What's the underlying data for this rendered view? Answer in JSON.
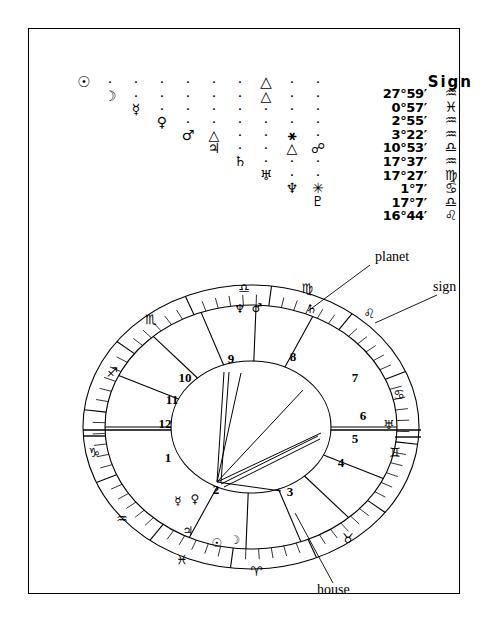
{
  "document": {
    "type": "astrological-natal-chart",
    "border_color": "#000000",
    "background": "#ffffff"
  },
  "aspect_grid": {
    "planets": [
      {
        "name": "Sun",
        "glyph": "☉"
      },
      {
        "name": "Moon",
        "glyph": "☽"
      },
      {
        "name": "Mercury",
        "glyph": "☿"
      },
      {
        "name": "Venus",
        "glyph": "♀"
      },
      {
        "name": "Mars",
        "glyph": "♂"
      },
      {
        "name": "Jupiter",
        "glyph": "♃"
      },
      {
        "name": "Saturn",
        "glyph": "♄"
      },
      {
        "name": "Uranus",
        "glyph": "♅"
      },
      {
        "name": "Neptune",
        "glyph": "♆"
      },
      {
        "name": "Pluto",
        "glyph": "♇"
      }
    ],
    "dot_glyph": "·",
    "columns": [
      {
        "planet": "Sun",
        "cells": [
          "☉"
        ]
      },
      {
        "planet": "Moon",
        "cells": [
          "·",
          "☽"
        ]
      },
      {
        "planet": "Mercury",
        "cells": [
          "·",
          "·",
          "☿"
        ]
      },
      {
        "planet": "Venus",
        "cells": [
          "·",
          "·",
          "·",
          "♀"
        ]
      },
      {
        "planet": "Mars",
        "cells": [
          "·",
          "·",
          "·",
          "·",
          "♂"
        ]
      },
      {
        "planet": "Jupiter",
        "cells": [
          "·",
          "·",
          "·",
          "·",
          "△",
          "♃"
        ]
      },
      {
        "planet": "Saturn",
        "cells": [
          "·",
          "·",
          "·",
          "·",
          "·",
          "·",
          "♄"
        ]
      },
      {
        "planet": "Uranus",
        "cells": [
          "△",
          "△",
          "·",
          "·",
          "·",
          "·",
          "·",
          "♅"
        ]
      },
      {
        "planet": "Neptune",
        "cells": [
          "·",
          "·",
          "·",
          "·",
          "⚹",
          "△",
          "·",
          "·",
          "♆"
        ]
      },
      {
        "planet": "Pluto",
        "cells": [
          "·",
          "·",
          "·",
          "·",
          "·",
          "☍",
          "·",
          "·",
          "✳",
          "♇"
        ]
      }
    ]
  },
  "position_table": {
    "sign_header": "Sign",
    "degree_symbol": "°",
    "minute_symbol": "′",
    "rows": [
      {
        "planet": "Sun",
        "degrees": "27",
        "minutes": "59",
        "text": "27°59′",
        "sign": "Aquarius",
        "sign_glyph": "♒"
      },
      {
        "planet": "Moon",
        "degrees": "0",
        "minutes": "57",
        "text": "0°57′",
        "sign": "Pisces",
        "sign_glyph": "♓"
      },
      {
        "planet": "Mercury",
        "degrees": "2",
        "minutes": "55",
        "text": "2°55′",
        "sign": "Aquarius",
        "sign_glyph": "♒"
      },
      {
        "planet": "Venus",
        "degrees": "3",
        "minutes": "22",
        "text": "3°22′",
        "sign": "Aquarius",
        "sign_glyph": "♒"
      },
      {
        "planet": "Mars",
        "degrees": "10",
        "minutes": "53",
        "text": "10°53′",
        "sign": "Libra",
        "sign_glyph": "♎"
      },
      {
        "planet": "Jupiter",
        "degrees": "17",
        "minutes": "37",
        "text": "17°37′",
        "sign": "Aquarius",
        "sign_glyph": "♒"
      },
      {
        "planet": "Saturn",
        "degrees": "17",
        "minutes": "27",
        "text": "17°27′",
        "sign": "Virgo",
        "sign_glyph": "♍"
      },
      {
        "planet": "Uranus",
        "degrees": "1",
        "minutes": "7",
        "text": "1°7′",
        "sign": "Cancer",
        "sign_glyph": "♋"
      },
      {
        "planet": "Neptune",
        "degrees": "17",
        "minutes": "7",
        "text": "17°7′",
        "sign": "Libra",
        "sign_glyph": "♎"
      },
      {
        "planet": "Pluto",
        "degrees": "16",
        "minutes": "44",
        "text": "16°44′",
        "sign": "Leo",
        "sign_glyph": "♌"
      }
    ]
  },
  "wheel": {
    "house_numbers": [
      "1",
      "2",
      "3",
      "4",
      "5",
      "6",
      "7",
      "8",
      "9",
      "10",
      "11",
      "12"
    ],
    "house_label_positions": [
      {
        "n": "9",
        "x": 166,
        "y": 112
      },
      {
        "n": "8",
        "x": 228,
        "y": 110
      },
      {
        "n": "10",
        "x": 120,
        "y": 131
      },
      {
        "n": "11",
        "x": 107,
        "y": 153
      },
      {
        "n": "12",
        "x": 100,
        "y": 177
      },
      {
        "n": "1",
        "x": 103,
        "y": 211
      },
      {
        "n": "2",
        "x": 151,
        "y": 243
      },
      {
        "n": "3",
        "x": 225,
        "y": 245
      },
      {
        "n": "4",
        "x": 276,
        "y": 216
      },
      {
        "n": "5",
        "x": 290,
        "y": 192
      },
      {
        "n": "6",
        "x": 298,
        "y": 169
      },
      {
        "n": "7",
        "x": 290,
        "y": 131
      }
    ],
    "sign_markers": [
      {
        "sign": "Libra",
        "glyph": "♎",
        "x": 179,
        "y": 42
      },
      {
        "sign": "Virgo",
        "glyph": "♍",
        "x": 242,
        "y": 42
      },
      {
        "sign": "Scorpio",
        "glyph": "♏",
        "x": 86,
        "y": 73
      },
      {
        "sign": "Leo",
        "glyph": "♌",
        "x": 304,
        "y": 67
      },
      {
        "sign": "Cancer",
        "glyph": "♋",
        "x": 334,
        "y": 148
      },
      {
        "sign": "Gemini",
        "glyph": "♊",
        "x": 330,
        "y": 206
      },
      {
        "sign": "Sagittarius",
        "glyph": "♐",
        "x": 47,
        "y": 126
      },
      {
        "sign": "Capricorn",
        "glyph": "♑",
        "x": 29,
        "y": 206
      },
      {
        "sign": "Aquarius",
        "glyph": "♒",
        "x": 57,
        "y": 272
      },
      {
        "sign": "Pisces",
        "glyph": "♓",
        "x": 117,
        "y": 313
      },
      {
        "sign": "Aries",
        "glyph": "♈",
        "x": 191,
        "y": 325
      },
      {
        "sign": "Taurus",
        "glyph": "♉",
        "x": 283,
        "y": 292
      }
    ],
    "planet_markers": [
      {
        "planet": "Neptune",
        "glyph": "♆",
        "x": 175,
        "y": 62
      },
      {
        "planet": "Mars",
        "glyph": "♂",
        "x": 192,
        "y": 61
      },
      {
        "planet": "Saturn",
        "glyph": "♄",
        "x": 247,
        "y": 62
      },
      {
        "planet": "Uranus",
        "glyph": "♅",
        "x": 324,
        "y": 178
      },
      {
        "planet": "Mercury",
        "glyph": "☿",
        "x": 113,
        "y": 254
      },
      {
        "planet": "Venus",
        "glyph": "♀",
        "x": 130,
        "y": 252
      },
      {
        "planet": "Jupiter",
        "glyph": "♃",
        "x": 123,
        "y": 284
      },
      {
        "planet": "Sun",
        "glyph": "☉",
        "x": 152,
        "y": 296
      },
      {
        "planet": "Moon",
        "glyph": "☽",
        "x": 170,
        "y": 293
      }
    ]
  },
  "callouts": [
    {
      "id": "planet-callout",
      "label": "planet",
      "x": 310,
      "y": 10
    },
    {
      "id": "sign-callout",
      "label": "sign",
      "x": 368,
      "y": 40
    },
    {
      "id": "house-callout",
      "label": "house",
      "x": 252,
      "y": 343
    }
  ]
}
